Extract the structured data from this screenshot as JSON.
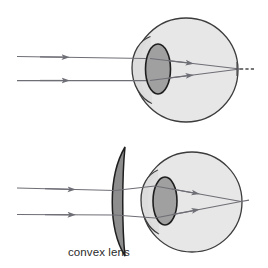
{
  "figure": {
    "background_color": "#ffffff",
    "width": 268,
    "height": 268
  },
  "palette": {
    "eyeball_fill": "#e7e7e7",
    "eyeball_stroke": "#3c3c3c",
    "cornea_fill": "#dcdcdc",
    "cornea_stroke": "#3c3c3c",
    "eye_lens_fill": "#a0a0a0",
    "eye_lens_stroke": "#1e1e1e",
    "ray_color": "#6e6e76",
    "corrective_lens_fill": "#8d8d8d",
    "corrective_lens_stroke": "#1e1e1e",
    "label_color": "#2b2b2b",
    "focal_marker_color": "#4a4a4a"
  },
  "panels": [
    {
      "id": "uncorrected",
      "name": "uncorrected-hyperopic-eye",
      "caption": "",
      "has_corrective_lens": false,
      "focal_point_location": "behind-retina",
      "eye": {
        "center_x": 186,
        "center_y": 70,
        "radius": 52,
        "cornea_label": "cornea",
        "lens_label": "lens",
        "retina_label": "retina"
      },
      "rays": [
        {
          "name": "upper-incoming-ray",
          "start_x": 17,
          "start_y": 56,
          "arrow_x": 62
        },
        {
          "name": "lower-incoming-ray",
          "start_x": 17,
          "start_y": 80,
          "arrow_x": 62
        }
      ],
      "focal_marker": {
        "name": "focal-point-marker",
        "x": 240,
        "y": 69,
        "style": "dashed-tick"
      }
    },
    {
      "id": "corrected",
      "name": "corrected-eye-with-convex-lens",
      "caption": "convex lens",
      "has_corrective_lens": true,
      "focal_point_location": "on-retina",
      "eye": {
        "center_x": 192,
        "center_y": 202,
        "radius": 50,
        "cornea_label": "cornea",
        "lens_label": "lens",
        "retina_label": "retina"
      },
      "rays": [
        {
          "name": "upper-incoming-ray",
          "start_x": 17,
          "start_y": 188,
          "arrow_x": 68
        },
        {
          "name": "lower-incoming-ray",
          "start_x": 17,
          "start_y": 214,
          "arrow_x": 68
        }
      ],
      "corrective_lens": {
        "name": "convex-lens",
        "label": "convex lens",
        "label_x": 68,
        "label_y": 256,
        "top_y": 147,
        "bottom_y": 256,
        "center_x": 121
      }
    }
  ],
  "labels": {
    "convex_lens": "convex lens"
  }
}
